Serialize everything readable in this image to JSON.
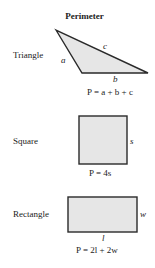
{
  "title": "Perimeter",
  "shapes": {
    "triangle": {
      "label": "Triangle",
      "sides": {
        "a": "a",
        "b": "b",
        "c": "c"
      },
      "formula": "P = a + b + c"
    },
    "square": {
      "label": "Square",
      "side": "s",
      "formula": "P = 4s"
    },
    "rectangle": {
      "label": "Rectangle",
      "length": "l",
      "width": "w",
      "formula": "P = 2l + 2w"
    }
  },
  "colors": {
    "fill": "#e6e6e6",
    "stroke": "#2a2a2a"
  }
}
